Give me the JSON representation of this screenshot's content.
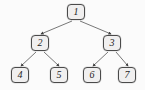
{
  "diagram": {
    "type": "binary-tree",
    "title": "",
    "canvas": {
      "width": 145,
      "height": 90,
      "background": "#fbfbfb"
    },
    "style": {
      "node_fill": "#f0efef",
      "node_stroke": "#4a4a4a",
      "edge_color": "#555555",
      "label_color": "#1d1d1d",
      "arrowhead": "filled-triangle"
    },
    "nodes": [
      {
        "id": "n1",
        "label": "1",
        "x": 67,
        "y": 4,
        "w": 18,
        "h": 16,
        "level": 0
      },
      {
        "id": "n2",
        "label": "2",
        "x": 31,
        "y": 35,
        "w": 18,
        "h": 16,
        "level": 1
      },
      {
        "id": "n3",
        "label": "3",
        "x": 103,
        "y": 35,
        "w": 18,
        "h": 16,
        "level": 1
      },
      {
        "id": "n4",
        "label": "4",
        "x": 11,
        "y": 67,
        "w": 18,
        "h": 16,
        "level": 2
      },
      {
        "id": "n5",
        "label": "5",
        "x": 50,
        "y": 67,
        "w": 18,
        "h": 16,
        "level": 2
      },
      {
        "id": "n6",
        "label": "6",
        "x": 83,
        "y": 67,
        "w": 18,
        "h": 16,
        "level": 2
      },
      {
        "id": "n7",
        "label": "7",
        "x": 118,
        "y": 67,
        "w": 18,
        "h": 16,
        "level": 2
      }
    ],
    "edges": [
      {
        "id": "e1",
        "from": "n1",
        "to": "n2",
        "x1": 72,
        "y1": 21,
        "x2": 41,
        "y2": 34,
        "directed": true
      },
      {
        "id": "e2",
        "from": "n1",
        "to": "n3",
        "x1": 80,
        "y1": 21,
        "x2": 111,
        "y2": 34,
        "directed": true
      },
      {
        "id": "e3",
        "from": "n2",
        "to": "n4",
        "x1": 36,
        "y1": 52,
        "x2": 21,
        "y2": 66,
        "directed": true
      },
      {
        "id": "e4",
        "from": "n2",
        "to": "n5",
        "x1": 44,
        "y1": 52,
        "x2": 59,
        "y2": 66,
        "directed": true
      },
      {
        "id": "e5",
        "from": "n3",
        "to": "n6",
        "x1": 108,
        "y1": 52,
        "x2": 93,
        "y2": 66,
        "directed": true
      },
      {
        "id": "e6",
        "from": "n3",
        "to": "n7",
        "x1": 116,
        "y1": 52,
        "x2": 128,
        "y2": 66,
        "directed": true
      }
    ]
  }
}
